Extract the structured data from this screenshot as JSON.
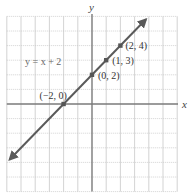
{
  "chart_data": {
    "type": "line",
    "title": "",
    "xlabel": "x",
    "ylabel": "y",
    "xlim": [
      -6,
      6
    ],
    "ylim": [
      -6,
      6
    ],
    "grid": true,
    "equation_label": "y = x + 2",
    "series": [
      {
        "name": "y = x + 2",
        "slope": 1,
        "intercept": 2,
        "line_extent": {
          "x_start": -5.8,
          "x_end": 3.8
        },
        "arrows": "both"
      }
    ],
    "points": [
      {
        "x": -2,
        "y": 0,
        "label": "(−2, 0)"
      },
      {
        "x": 0,
        "y": 2,
        "label": "(0, 2)"
      },
      {
        "x": 1,
        "y": 3,
        "label": "(1, 3)"
      },
      {
        "x": 2,
        "y": 4,
        "label": "(2, 4)"
      }
    ]
  },
  "colors": {
    "grid": "#c8c8c8",
    "axis": "#7a7a7a",
    "line": "#5a5a5a",
    "point": "#555555",
    "text": "#333333"
  }
}
